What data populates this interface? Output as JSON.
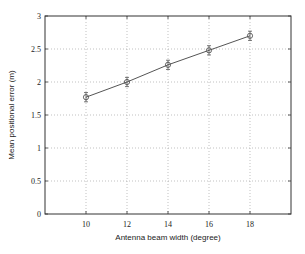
{
  "chart_data": {
    "type": "line",
    "title": "",
    "xlabel": "Antenna beam width (degree)",
    "ylabel": "Mean positional error (m)",
    "x": [
      10,
      12,
      14,
      16,
      18
    ],
    "series": [
      {
        "name": "Mean positional error",
        "values": [
          1.77,
          2.0,
          2.26,
          2.48,
          2.7
        ],
        "error": [
          0.07,
          0.07,
          0.07,
          0.07,
          0.07
        ],
        "marker": "circle",
        "color": "#555555"
      }
    ],
    "xlim": [
      8,
      20
    ],
    "ylim": [
      0,
      3
    ],
    "xticks": [
      "10",
      "12",
      "14",
      "16",
      "18"
    ],
    "yticks": [
      "0",
      "0.5",
      "1",
      "1.5",
      "2",
      "2.5",
      "3"
    ],
    "grid": true,
    "legend": null
  }
}
